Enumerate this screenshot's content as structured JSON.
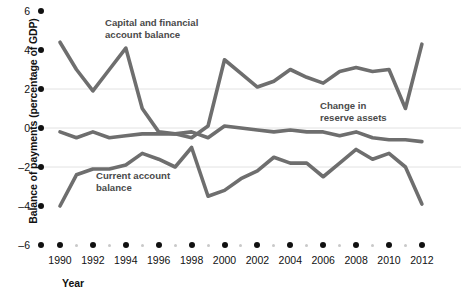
{
  "chart_data": {
    "type": "line",
    "title": "",
    "xlabel": "Year",
    "ylabel": "Balance of payments (percentage of GDP)",
    "xlim": [
      1990,
      2012
    ],
    "ylim": [
      -6,
      6
    ],
    "yticks": [
      6,
      4,
      2,
      0,
      -2,
      -4,
      -6
    ],
    "ytick_labels": [
      "6",
      "4",
      "2",
      "0",
      "–2",
      "–4",
      "–6"
    ],
    "xticks": [
      1990,
      1992,
      1994,
      1996,
      1998,
      2000,
      2002,
      2004,
      2006,
      2008,
      2010,
      2012
    ],
    "xtick_labels": [
      "1990",
      "1992",
      "1994",
      "1996",
      "1998",
      "2000",
      "2002",
      "2004",
      "2006",
      "2008",
      "2010",
      "2012"
    ],
    "x": [
      1990,
      1991,
      1992,
      1993,
      1994,
      1995,
      1996,
      1997,
      1998,
      1999,
      2000,
      2001,
      2002,
      2003,
      2004,
      2005,
      2006,
      2007,
      2008,
      2009,
      2010,
      2011,
      2012
    ],
    "grid": "horizontal-faint",
    "gridlines": [
      2,
      0,
      -2
    ],
    "legend_position": "inline-annotations",
    "line_color": "#6e6e6e",
    "axis_color": "#111111",
    "series": [
      {
        "name": "Capital and financial account balance",
        "values": [
          4.4,
          3.0,
          1.9,
          3.0,
          4.1,
          1.0,
          -0.2,
          -0.3,
          -0.5,
          0.1,
          3.5,
          2.8,
          2.1,
          2.4,
          3.0,
          2.6,
          2.3,
          2.9,
          3.1,
          2.9,
          3.0,
          1.0,
          4.3
        ]
      },
      {
        "name": "Current account balance",
        "values": [
          -4.0,
          -2.4,
          -2.1,
          -2.1,
          -1.9,
          -1.3,
          -1.6,
          -2.0,
          -1.0,
          -3.5,
          -3.2,
          -2.6,
          -2.2,
          -1.5,
          -1.8,
          -1.8,
          -2.5,
          -1.8,
          -1.1,
          -1.6,
          -1.3,
          -2.0,
          -3.9
        ]
      },
      {
        "name": "Change in reserve assets",
        "values": [
          -0.2,
          -0.5,
          -0.2,
          -0.5,
          -0.4,
          -0.3,
          -0.3,
          -0.3,
          -0.2,
          -0.5,
          0.1,
          0.0,
          -0.1,
          -0.2,
          -0.1,
          -0.2,
          -0.2,
          -0.4,
          -0.2,
          -0.5,
          -0.6,
          -0.6,
          -0.7
        ]
      }
    ],
    "annotations": [
      {
        "id": "capital",
        "text": "Capital and financial\naccount balance"
      },
      {
        "id": "current",
        "text": "Current account\nbalance"
      },
      {
        "id": "reserve",
        "text": "Change in\nreserve assets"
      }
    ]
  }
}
